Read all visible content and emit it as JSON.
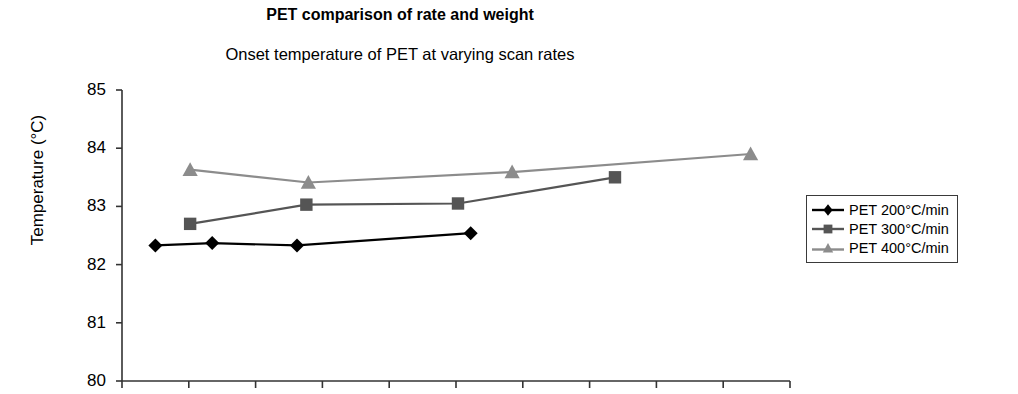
{
  "chart_data": {
    "type": "line",
    "title": "PET comparison of rate and weight",
    "subtitle": "Onset temperature of PET at varying scan rates",
    "xlabel": "",
    "ylabel": "Temperature (°C)",
    "ylim": [
      80,
      85
    ],
    "ytick_labels": [
      "85",
      "84",
      "83",
      "82",
      "81",
      "80"
    ],
    "ytick_values": [
      85,
      84,
      83,
      82,
      81,
      80
    ],
    "xlim": [
      0,
      10
    ],
    "xtick_labels": [
      "",
      "",
      "",
      "",
      "",
      "",
      "",
      "",
      "",
      "",
      ""
    ],
    "xtick_values": [
      0,
      1,
      2,
      3,
      4,
      5,
      6,
      7,
      8,
      9,
      10
    ],
    "grid": false,
    "legend_position": "right",
    "series": [
      {
        "name": "PET 200°C/min",
        "marker": "diamond",
        "color": "#000000",
        "x": [
          0.5,
          1.35,
          2.62,
          5.22
        ],
        "values": [
          82.33,
          82.37,
          82.33,
          82.54
        ]
      },
      {
        "name": "PET 300°C/min",
        "marker": "square",
        "color": "#555555",
        "x": [
          1.02,
          2.76,
          5.03,
          7.38
        ],
        "values": [
          82.7,
          83.03,
          83.05,
          83.5
        ]
      },
      {
        "name": "PET 400°C/min",
        "marker": "triangle",
        "color": "#8c8c8c",
        "x": [
          1.02,
          2.79,
          5.84,
          9.41
        ],
        "values": [
          83.63,
          83.41,
          83.59,
          83.9
        ]
      }
    ]
  },
  "legend": {
    "items": [
      {
        "label": "PET 200°C/min",
        "color": "#000000",
        "marker": "diamond"
      },
      {
        "label": "PET 300°C/min",
        "color": "#555555",
        "marker": "square"
      },
      {
        "label": "PET 400°C/min",
        "color": "#8c8c8c",
        "marker": "triangle"
      }
    ]
  },
  "axis_colors": {
    "axis_line": "#333333",
    "background": "#ffffff"
  }
}
